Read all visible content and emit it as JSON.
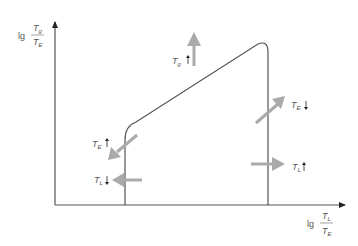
{
  "diagram": {
    "y_axis_label": {
      "prefix": "lg",
      "numerator": "T",
      "numerator_sub": "g",
      "denominator": "T",
      "denominator_sub": "E"
    },
    "x_axis_label": {
      "prefix": "lg",
      "numerator": "T",
      "numerator_sub": "L",
      "denominator": "T",
      "denominator_sub": "E"
    },
    "annotations": [
      {
        "id": "tg-up",
        "var": "T",
        "sub": "g",
        "direction": "up"
      },
      {
        "id": "te-down",
        "var": "T",
        "sub": "E",
        "direction": "down"
      },
      {
        "id": "te-up",
        "var": "T",
        "sub": "E",
        "direction": "up"
      },
      {
        "id": "tl-down",
        "var": "T",
        "sub": "L",
        "direction": "down"
      },
      {
        "id": "tl-up",
        "var": "T",
        "sub": "L",
        "direction": "up"
      }
    ],
    "colors": {
      "axis": "#444444",
      "curve": "#555555",
      "arrow": "#aaaaaa",
      "text": "#555555"
    }
  }
}
